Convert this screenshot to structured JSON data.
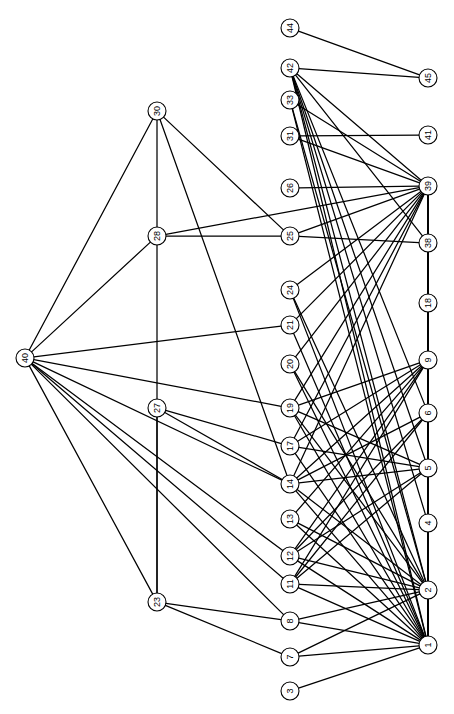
{
  "chart_data": {
    "type": "diagram",
    "subtype": "node-link-network-graph",
    "title": "",
    "xlabel": "",
    "ylabel": "",
    "orientation": "labels-rotated-90deg",
    "layout": "three-column layered graph",
    "background_color": "#ffffff",
    "node_fill_color": "#ffffff",
    "node_stroke_color": "#000000",
    "edge_color": "#000000",
    "node_radius": 9,
    "node_count": 31,
    "edge_count": 86,
    "nodes": [
      {
        "id": "44",
        "label": "44",
        "x": 290,
        "y": 28,
        "column": "middle"
      },
      {
        "id": "42",
        "label": "42",
        "x": 290,
        "y": 68,
        "column": "middle"
      },
      {
        "id": "33",
        "label": "33",
        "x": 290,
        "y": 100,
        "column": "middle"
      },
      {
        "id": "31",
        "label": "31",
        "x": 290,
        "y": 136,
        "column": "middle"
      },
      {
        "id": "26",
        "label": "26",
        "x": 290,
        "y": 188,
        "column": "middle"
      },
      {
        "id": "25",
        "label": "25",
        "x": 290,
        "y": 236,
        "column": "middle"
      },
      {
        "id": "24",
        "label": "24",
        "x": 290,
        "y": 290,
        "column": "middle"
      },
      {
        "id": "21",
        "label": "21",
        "x": 290,
        "y": 325,
        "column": "middle"
      },
      {
        "id": "20",
        "label": "20",
        "x": 290,
        "y": 364,
        "column": "middle"
      },
      {
        "id": "19",
        "label": "19",
        "x": 290,
        "y": 408,
        "column": "middle"
      },
      {
        "id": "17",
        "label": "17",
        "x": 290,
        "y": 446,
        "column": "middle"
      },
      {
        "id": "14",
        "label": "14",
        "x": 290,
        "y": 484,
        "column": "middle"
      },
      {
        "id": "13",
        "label": "13",
        "x": 290,
        "y": 519,
        "column": "middle"
      },
      {
        "id": "12",
        "label": "12",
        "x": 290,
        "y": 556,
        "column": "middle"
      },
      {
        "id": "11",
        "label": "11",
        "x": 290,
        "y": 584,
        "column": "middle"
      },
      {
        "id": "8",
        "label": "8",
        "x": 290,
        "y": 621,
        "column": "middle"
      },
      {
        "id": "7",
        "label": "7",
        "x": 290,
        "y": 657,
        "column": "middle"
      },
      {
        "id": "3",
        "label": "3",
        "x": 290,
        "y": 691,
        "column": "middle"
      },
      {
        "id": "45",
        "label": "45",
        "x": 428,
        "y": 78,
        "column": "right"
      },
      {
        "id": "41",
        "label": "41",
        "x": 428,
        "y": 135,
        "column": "right"
      },
      {
        "id": "39",
        "label": "39",
        "x": 428,
        "y": 186,
        "column": "right"
      },
      {
        "id": "38",
        "label": "38",
        "x": 428,
        "y": 243,
        "column": "right"
      },
      {
        "id": "18",
        "label": "18",
        "x": 428,
        "y": 303,
        "column": "right"
      },
      {
        "id": "9",
        "label": "9",
        "x": 428,
        "y": 360,
        "column": "right"
      },
      {
        "id": "6",
        "label": "6",
        "x": 428,
        "y": 413,
        "column": "right"
      },
      {
        "id": "5",
        "label": "5",
        "x": 428,
        "y": 468,
        "column": "right"
      },
      {
        "id": "4",
        "label": "4",
        "x": 428,
        "y": 523,
        "column": "right"
      },
      {
        "id": "2",
        "label": "2",
        "x": 428,
        "y": 590,
        "column": "right"
      },
      {
        "id": "1",
        "label": "1",
        "x": 428,
        "y": 645,
        "column": "right"
      },
      {
        "id": "30",
        "label": "30",
        "x": 157,
        "y": 111,
        "column": "left"
      },
      {
        "id": "28",
        "label": "28",
        "x": 157,
        "y": 236,
        "column": "left"
      },
      {
        "id": "40",
        "label": "40",
        "x": 25,
        "y": 358,
        "column": "left"
      },
      {
        "id": "27",
        "label": "27",
        "x": 157,
        "y": 408,
        "column": "left"
      },
      {
        "id": "23",
        "label": "23",
        "x": 157,
        "y": 602,
        "column": "left"
      }
    ],
    "edges": [
      [
        "44",
        "45"
      ],
      [
        "42",
        "45"
      ],
      [
        "42",
        "39"
      ],
      [
        "42",
        "38"
      ],
      [
        "42",
        "2"
      ],
      [
        "42",
        "1"
      ],
      [
        "42",
        "5"
      ],
      [
        "42",
        "4"
      ],
      [
        "42",
        "6"
      ],
      [
        "33",
        "39"
      ],
      [
        "33",
        "2"
      ],
      [
        "33",
        "1"
      ],
      [
        "31",
        "41"
      ],
      [
        "31",
        "39"
      ],
      [
        "26",
        "39"
      ],
      [
        "25",
        "39"
      ],
      [
        "25",
        "38"
      ],
      [
        "25",
        "28"
      ],
      [
        "25",
        "30"
      ],
      [
        "24",
        "39"
      ],
      [
        "24",
        "2"
      ],
      [
        "24",
        "1"
      ],
      [
        "21",
        "40"
      ],
      [
        "21",
        "39"
      ],
      [
        "21",
        "1"
      ],
      [
        "20",
        "39"
      ],
      [
        "20",
        "1"
      ],
      [
        "20",
        "2"
      ],
      [
        "19",
        "40"
      ],
      [
        "19",
        "39"
      ],
      [
        "19",
        "9"
      ],
      [
        "19",
        "5"
      ],
      [
        "19",
        "1"
      ],
      [
        "19",
        "2"
      ],
      [
        "17",
        "39"
      ],
      [
        "17",
        "9"
      ],
      [
        "17",
        "5"
      ],
      [
        "17",
        "1"
      ],
      [
        "17",
        "27"
      ],
      [
        "14",
        "39"
      ],
      [
        "14",
        "9"
      ],
      [
        "14",
        "6"
      ],
      [
        "14",
        "5"
      ],
      [
        "14",
        "2"
      ],
      [
        "14",
        "1"
      ],
      [
        "14",
        "27"
      ],
      [
        "14",
        "30"
      ],
      [
        "13",
        "9"
      ],
      [
        "13",
        "1"
      ],
      [
        "13",
        "2"
      ],
      [
        "12",
        "9"
      ],
      [
        "12",
        "6"
      ],
      [
        "12",
        "5"
      ],
      [
        "12",
        "2"
      ],
      [
        "12",
        "1"
      ],
      [
        "12",
        "40"
      ],
      [
        "11",
        "9"
      ],
      [
        "11",
        "6"
      ],
      [
        "11",
        "5"
      ],
      [
        "11",
        "2"
      ],
      [
        "11",
        "1"
      ],
      [
        "11",
        "40"
      ],
      [
        "8",
        "2"
      ],
      [
        "8",
        "1"
      ],
      [
        "8",
        "23"
      ],
      [
        "8",
        "40"
      ],
      [
        "7",
        "2"
      ],
      [
        "7",
        "1"
      ],
      [
        "7",
        "23"
      ],
      [
        "3",
        "1"
      ],
      [
        "40",
        "30"
      ],
      [
        "40",
        "28"
      ],
      [
        "40",
        "14"
      ],
      [
        "40",
        "23"
      ],
      [
        "30",
        "23"
      ],
      [
        "28",
        "39"
      ],
      [
        "27",
        "23"
      ],
      [
        "39",
        "18"
      ],
      [
        "39",
        "9"
      ],
      [
        "39",
        "6"
      ],
      [
        "39",
        "5"
      ],
      [
        "38",
        "1"
      ],
      [
        "18",
        "1"
      ],
      [
        "9",
        "1"
      ],
      [
        "6",
        "5"
      ],
      [
        "5",
        "1"
      ],
      [
        "2",
        "1"
      ]
    ]
  },
  "meta": {
    "node_label_rotation": "-90",
    "image_width": 454,
    "image_height": 714
  }
}
